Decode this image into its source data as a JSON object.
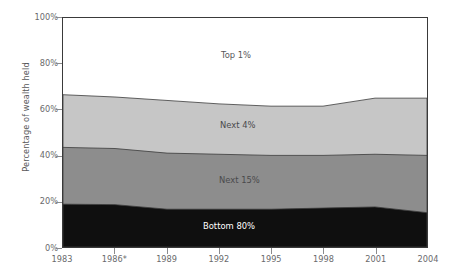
{
  "chart_data": {
    "type": "area",
    "stacked": true,
    "title": "",
    "xlabel": "",
    "ylabel": "Percentage of wealth held",
    "x": [
      "1983",
      "1986*",
      "1989",
      "1992",
      "1995",
      "1998",
      "2001",
      "2004"
    ],
    "x_tick_labels": [
      "1983",
      "1986*",
      "1989",
      "1992",
      "1995",
      "1998",
      "2001",
      "2004"
    ],
    "y_tick_labels": [
      "0%",
      "20%",
      "40%",
      "60%",
      "80%",
      "100%"
    ],
    "y_tick_values": [
      0,
      20,
      40,
      60,
      80,
      100
    ],
    "ylim": [
      0,
      100
    ],
    "grid": false,
    "legend_position": "inline-labels",
    "series": [
      {
        "name": "Bottom 80%",
        "color": "#0f0f0f",
        "values": [
          18.7,
          18.5,
          16.5,
          16.5,
          16.5,
          17.0,
          17.5,
          15.0
        ],
        "label_text": "Bottom 80%"
      },
      {
        "name": "Next 15%",
        "color": "#8d8d8d",
        "values": [
          24.8,
          24.5,
          24.5,
          24.0,
          23.5,
          23.0,
          23.0,
          25.0
        ],
        "label_text": "Next 15%"
      },
      {
        "name": "Next 4%",
        "color": "#c6c6c6",
        "values": [
          23.0,
          22.5,
          23.0,
          22.0,
          21.5,
          21.5,
          24.5,
          25.0
        ],
        "label_text": "Next 4%"
      },
      {
        "name": "Top 1%",
        "color": "#ffffff",
        "values": [
          33.5,
          34.5,
          36.0,
          37.5,
          38.5,
          38.5,
          35.0,
          35.0
        ],
        "label_text": "Top 1%"
      }
    ],
    "cumulative_boundaries": {
      "bottom80_top": [
        18.7,
        18.5,
        16.5,
        16.5,
        16.5,
        17.0,
        17.5,
        15.0
      ],
      "next15_top": [
        43.5,
        43.0,
        41.0,
        40.5,
        40.0,
        40.0,
        40.5,
        40.0
      ],
      "next4_top": [
        66.5,
        65.5,
        64.0,
        62.5,
        61.5,
        61.5,
        65.0,
        65.0
      ]
    },
    "footnote_marker": "*"
  },
  "colors": {
    "bottom80": "#0f0f0f",
    "next15": "#8d8d8d",
    "next4": "#c6c6c6",
    "top1": "#ffffff",
    "axis": "#3a3a3a",
    "tick_text": "#6a6a6c"
  }
}
